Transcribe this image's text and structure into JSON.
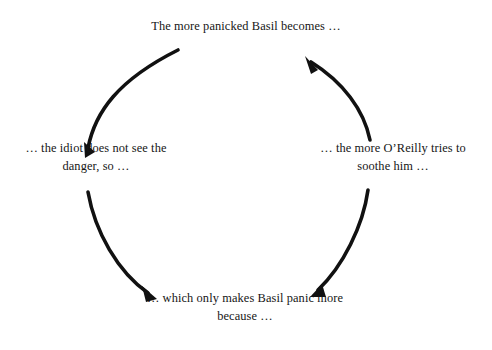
{
  "diagram": {
    "type": "vicious-cycle",
    "title": "",
    "background_color": "#ffffff",
    "text_color": "#161616",
    "arc_color": "#111111",
    "direction": "clockwise",
    "nodes": [
      {
        "id": "top",
        "position": "top",
        "text": "The more panicked Basil becomes …"
      },
      {
        "id": "right",
        "position": "right",
        "text": "… the more O’Reilly tries to soothe him …"
      },
      {
        "id": "bottom",
        "position": "bottom",
        "text": "… which only makes Basil panic more because …"
      },
      {
        "id": "left",
        "position": "left",
        "text": "… the idiot does not see the danger, so …"
      }
    ],
    "arrows": [
      {
        "id": "arc-top-right",
        "from": "top",
        "to": "right",
        "points_to": "right"
      },
      {
        "id": "arc-right-bottom",
        "from": "right",
        "to": "bottom",
        "points_to": "bottom"
      },
      {
        "id": "arc-bottom-left",
        "from": "bottom",
        "to": "left",
        "points_to": "left"
      },
      {
        "id": "arc-left-top",
        "from": "left",
        "to": "top",
        "points_to": "top"
      }
    ]
  }
}
